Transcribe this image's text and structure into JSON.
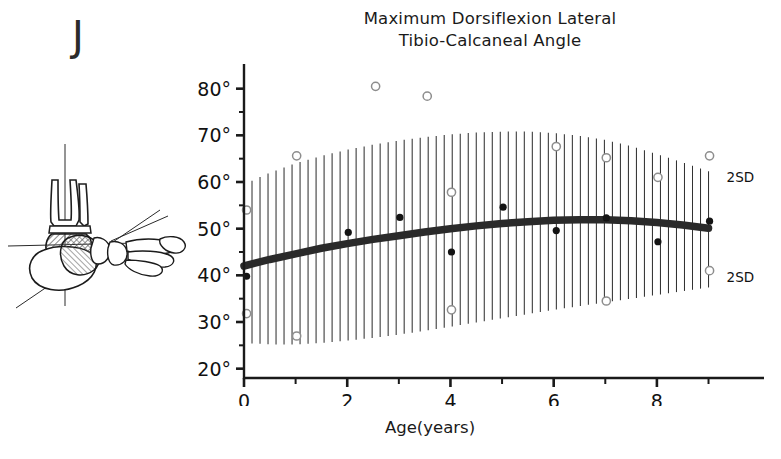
{
  "figure": {
    "panel_label": "J",
    "title_line1": "Maximum Dorsiflexion Lateral",
    "title_line2": "Tibio-Calcaneal Angle",
    "xaxis_title": "Age(years)",
    "sd_label_upper": "2SD",
    "sd_label_lower": "2SD",
    "ink_color": "#1a1a1a",
    "band_color": "#2a2a2a",
    "marker_filled_color": "#141414",
    "marker_open_color": "#8d8d8d"
  },
  "diagram": {
    "name": "lateral-foot-radiograph-tracing",
    "caption": "",
    "description_parts": [
      "tibia-axis-line",
      "calcaneal-axis-line",
      "talus-shading",
      "metatarsals"
    ]
  },
  "chart_data": {
    "type": "line",
    "title": "Maximum Dorsiflexion Lateral Tibio-Calcaneal Angle",
    "subtitle": "",
    "xlabel": "Age(years)",
    "ylabel": "",
    "xlim": [
      0,
      9.3
    ],
    "ylim": [
      18,
      84
    ],
    "grid": false,
    "legend_position": "right-inline",
    "yticks_major": [
      20,
      30,
      40,
      50,
      60,
      70,
      80
    ],
    "ytick_labels": [
      "20°",
      "30°",
      "40°",
      "50°",
      "60°",
      "70°",
      "80°"
    ],
    "yticks_minor": [
      25,
      35,
      45,
      55,
      65,
      75
    ],
    "xticks_major": [
      0,
      2,
      4,
      6,
      8
    ],
    "xtick_labels": [
      "0",
      "2",
      "4",
      "6",
      "8"
    ],
    "xticks_minor": [
      1,
      3,
      5,
      7,
      9
    ],
    "series": [
      {
        "name": "mean",
        "style": "thick-solid-line",
        "x": [
          0,
          0.5,
          1,
          1.5,
          2,
          2.5,
          3,
          3.5,
          4,
          4.5,
          5,
          5.5,
          6,
          6.5,
          7,
          7.5,
          8,
          8.5,
          9
        ],
        "values": [
          42.0,
          43.4,
          44.6,
          45.8,
          46.8,
          47.7,
          48.5,
          49.3,
          50.0,
          50.6,
          51.1,
          51.5,
          51.8,
          51.9,
          51.9,
          51.7,
          51.3,
          50.8,
          50.1
        ]
      },
      {
        "name": "+2SD",
        "style": "hatch-envelope-upper",
        "x": [
          0,
          0.5,
          1,
          1.5,
          2,
          2.5,
          3,
          3.5,
          4,
          4.5,
          5,
          5.5,
          6,
          6.5,
          7,
          7.5,
          8,
          8.5,
          9
        ],
        "values": [
          59.5,
          62.0,
          64.0,
          65.6,
          66.9,
          68.0,
          68.9,
          69.6,
          70.2,
          70.6,
          70.8,
          70.8,
          70.5,
          69.9,
          69.0,
          67.7,
          66.0,
          64.2,
          62.3
        ]
      },
      {
        "name": "-2SD",
        "style": "hatch-envelope-lower",
        "x": [
          0,
          0.5,
          1,
          1.5,
          2,
          2.5,
          3,
          3.5,
          4,
          4.5,
          5,
          5.5,
          6,
          6.5,
          7,
          7.5,
          8,
          8.5,
          9
        ],
        "values": [
          25.5,
          25.2,
          25.2,
          25.5,
          26.0,
          26.6,
          27.3,
          28.1,
          29.0,
          29.9,
          30.8,
          31.7,
          32.6,
          33.4,
          34.2,
          35.0,
          35.8,
          36.6,
          37.4
        ]
      }
    ],
    "scatter_filled": {
      "name": "individual measurements",
      "marker": "filled-circle",
      "points": [
        {
          "x": 0.05,
          "y": 39.8
        },
        {
          "x": 2.02,
          "y": 49.2
        },
        {
          "x": 3.02,
          "y": 52.4
        },
        {
          "x": 4.02,
          "y": 45.0
        },
        {
          "x": 5.02,
          "y": 54.6
        },
        {
          "x": 6.05,
          "y": 49.6
        },
        {
          "x": 7.02,
          "y": 52.3
        },
        {
          "x": 8.02,
          "y": 47.2
        },
        {
          "x": 9.02,
          "y": 51.6
        }
      ]
    },
    "scatter_open": {
      "name": "±2SD reference observations",
      "marker": "open-circle",
      "points": [
        {
          "x": 0.05,
          "y": 54.0
        },
        {
          "x": 0.05,
          "y": 31.8
        },
        {
          "x": 1.02,
          "y": 65.6
        },
        {
          "x": 1.02,
          "y": 27.0
        },
        {
          "x": 2.55,
          "y": 80.5
        },
        {
          "x": 3.55,
          "y": 78.4
        },
        {
          "x": 4.02,
          "y": 57.8
        },
        {
          "x": 4.02,
          "y": 32.6
        },
        {
          "x": 6.05,
          "y": 67.6
        },
        {
          "x": 7.02,
          "y": 65.2
        },
        {
          "x": 7.02,
          "y": 34.5
        },
        {
          "x": 8.02,
          "y": 61.0
        },
        {
          "x": 9.02,
          "y": 65.6
        },
        {
          "x": 9.02,
          "y": 41.0
        }
      ]
    },
    "annotations": [
      {
        "text": "2SD",
        "x": 9.35,
        "y": 61.0,
        "anchor": "start"
      },
      {
        "text": "2SD",
        "x": 9.35,
        "y": 39.6,
        "anchor": "start"
      }
    ]
  }
}
